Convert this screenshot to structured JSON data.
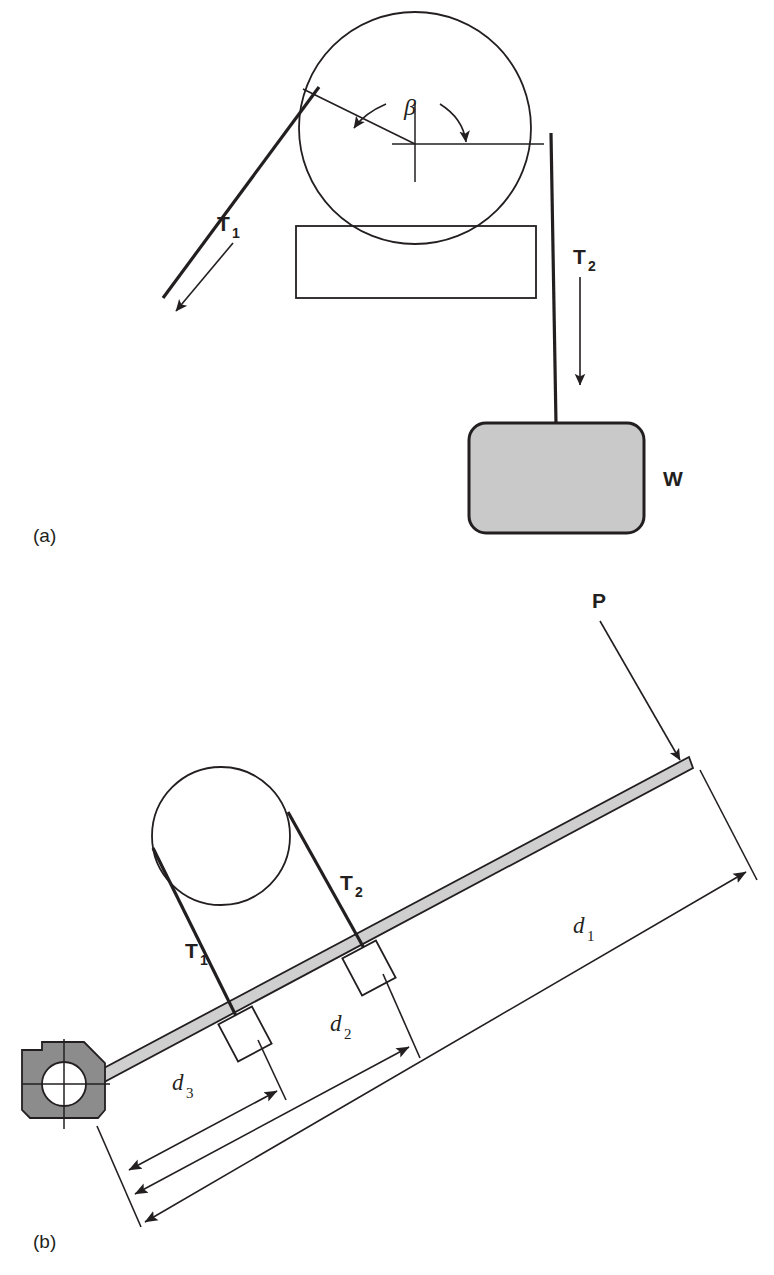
{
  "figure": {
    "panels": [
      {
        "key": "a",
        "caption": "(a)",
        "description": "Band wrapped over a drum with tensions T1 and T2 supporting weight W",
        "labels": {
          "t1": "T",
          "t1_sub": "1",
          "t2": "T",
          "t2_sub": "2",
          "weight": "W",
          "angle": "β"
        }
      },
      {
        "key": "b",
        "caption": "(b)",
        "description": "Lever arm pivoted at a bracket with band tensions T1 and T2 and applied force P",
        "labels": {
          "t1": "T",
          "t1_sub": "1",
          "t2": "T",
          "t2_sub": "2",
          "force": "P",
          "d1": "d",
          "d1_sub": "1",
          "d2": "d",
          "d2_sub": "2",
          "d3": "d",
          "d3_sub": "3"
        }
      }
    ]
  },
  "colors": {
    "ink": "#231f20",
    "weight_fill": "#c9c9c9",
    "lever_fill": "#cfcfcf",
    "bracket_fill": "#8c8c8c",
    "background": "#ffffff"
  }
}
